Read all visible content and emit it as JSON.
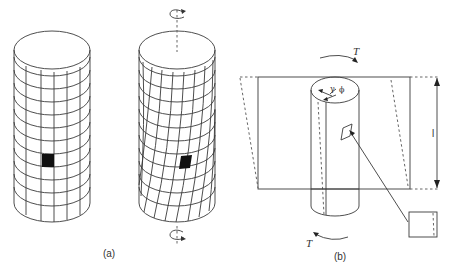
{
  "figure": {
    "panels": [
      {
        "id": "a",
        "label": "(a)",
        "description": "Cylinder with rectangular grid before and after twisting; a shaded element distorts under torsion",
        "cylinders": [
          {
            "name": "untwisted-cylinder",
            "grid_rows": 11,
            "grid_columns_visible": 6,
            "shaded_element": true
          },
          {
            "name": "twisted-cylinder",
            "grid_rows": 11,
            "grid_columns_visible": 7,
            "shaded_element": true,
            "rotation_arrows": [
              "top",
              "bottom"
            ]
          }
        ]
      },
      {
        "id": "b",
        "label": "(b)",
        "description": "Cylinder under torque T with shear angle and length l; element shown enlarged",
        "torque_top_label": "T",
        "torque_bottom_label": "T",
        "length_label": "l",
        "shear_angle_label": "γ",
        "twist_angle_label": "ϕ"
      }
    ],
    "colors": {
      "line": "#3a3a3a",
      "shaded_element": "#111111",
      "background": "#ffffff"
    }
  }
}
